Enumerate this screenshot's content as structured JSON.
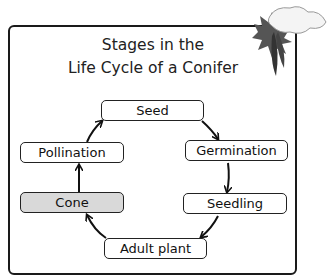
{
  "diagram": {
    "title_line1": "Stages in the",
    "title_line2": "Life Cycle of a Conifer",
    "stages": [
      {
        "id": "seed",
        "label": "Seed",
        "highlighted": false
      },
      {
        "id": "germination",
        "label": "Germination",
        "highlighted": false
      },
      {
        "id": "seedling",
        "label": "Seedling",
        "highlighted": false
      },
      {
        "id": "adult-plant",
        "label": "Adult plant",
        "highlighted": false
      },
      {
        "id": "cone",
        "label": "Cone",
        "highlighted": true
      },
      {
        "id": "pollination",
        "label": "Pollination",
        "highlighted": false
      }
    ],
    "cycle_order": [
      "Seed",
      "Germination",
      "Seedling",
      "Adult plant",
      "Cone",
      "Pollination",
      "Seed"
    ],
    "decoration": "snow-covered-conifer-branch-with-cone",
    "colors": {
      "border": "#1a1a1a",
      "highlight_fill": "#d9d9d9",
      "box_fill": "#ffffff"
    }
  }
}
